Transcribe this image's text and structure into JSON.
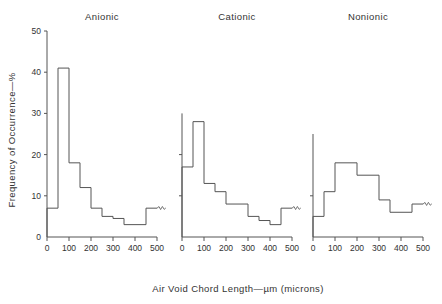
{
  "figure": {
    "xlabel": "Air Void Chord Length—µm (microns)",
    "ylabel": "Frequency of Occurrence—%",
    "end_marker": "squiggle-break-marker"
  },
  "chart_data": [
    {
      "type": "bar",
      "title": "Anionic",
      "xlabel": "Air Void Chord Length—µm (microns)",
      "ylabel": "Frequency of Occurrence—%",
      "xlim": [
        0,
        500
      ],
      "ylim": [
        0,
        50
      ],
      "xticks": [
        0,
        100,
        200,
        300,
        400,
        500
      ],
      "yticks": [
        0,
        10,
        20,
        30,
        40,
        50
      ],
      "bin_width": 50,
      "bin_edges": [
        0,
        50,
        100,
        150,
        200,
        250,
        300,
        350,
        400,
        450,
        500
      ],
      "categories": [
        "0-50",
        "50-100",
        "100-150",
        "150-200",
        "200-250",
        "250-300",
        "300-350",
        "350-400",
        "400-450",
        "450-500"
      ],
      "values": [
        7,
        41,
        18,
        12,
        7,
        5,
        4.5,
        3,
        3,
        7
      ],
      "grid": false,
      "legend": null
    },
    {
      "type": "bar",
      "title": "Cationic",
      "xlabel": "Air Void Chord Length—µm (microns)",
      "ylabel": "Frequency of Occurrence—%",
      "xlim": [
        0,
        500
      ],
      "ylim": [
        0,
        50
      ],
      "xticks": [
        0,
        100,
        200,
        300,
        400,
        500
      ],
      "yticks": [
        0,
        10,
        20,
        30,
        40,
        50
      ],
      "bin_width": 50,
      "bin_edges": [
        0,
        50,
        100,
        150,
        200,
        250,
        300,
        350,
        400,
        450,
        500
      ],
      "categories": [
        "0-50",
        "50-100",
        "100-150",
        "150-200",
        "200-250",
        "250-300",
        "300-350",
        "350-400",
        "400-450",
        "450-500"
      ],
      "values": [
        17,
        28,
        13,
        11,
        8,
        8,
        5,
        4,
        3,
        7
      ],
      "grid": false,
      "legend": null
    },
    {
      "type": "bar",
      "title": "Nonionic",
      "xlabel": "Air Void Chord Length—µm (microns)",
      "ylabel": "Frequency of Occurrence—%",
      "xlim": [
        0,
        500
      ],
      "ylim": [
        0,
        50
      ],
      "xticks": [
        0,
        100,
        200,
        300,
        400,
        500
      ],
      "yticks": [
        0,
        10,
        20,
        30,
        40,
        50
      ],
      "bin_width": 50,
      "bin_edges": [
        0,
        50,
        100,
        150,
        200,
        250,
        300,
        350,
        400,
        450,
        500
      ],
      "categories": [
        "0-50",
        "50-100",
        "100-150",
        "150-200",
        "200-250",
        "250-300",
        "300-350",
        "350-400",
        "400-450",
        "450-500"
      ],
      "values": [
        5,
        11,
        18,
        18,
        15,
        15,
        9,
        6,
        6,
        8,
        13
      ],
      "grid": false,
      "legend": null
    }
  ],
  "panels": [
    {
      "title": "Anionic",
      "xticklabels": [
        "0",
        "100",
        "200",
        "300",
        "400",
        "500"
      ],
      "yticklabels": [
        "0",
        "10",
        "20",
        "30",
        "40",
        "50"
      ]
    },
    {
      "title": "Cationic",
      "xticklabels": [
        "0",
        "100",
        "200",
        "300",
        "400",
        "500"
      ],
      "yticklabels": [
        "0",
        "10",
        "20",
        "30",
        "40",
        "50"
      ]
    },
    {
      "title": "Nonionic",
      "xticklabels": [
        "0",
        "100",
        "200",
        "300",
        "400",
        "500"
      ],
      "yticklabels": [
        "0",
        "10",
        "20",
        "30",
        "40",
        "50"
      ]
    }
  ]
}
